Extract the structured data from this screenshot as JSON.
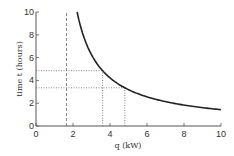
{
  "chart_data": {
    "type": "line",
    "title": "",
    "xlabel": "q (kW)",
    "ylabel": "time t (hours)",
    "xlim": [
      0,
      10
    ],
    "ylim": [
      0,
      10
    ],
    "xticks": [
      "0",
      "2",
      "4",
      "6",
      "8",
      "10"
    ],
    "yticks": [
      "0",
      "2",
      "4",
      "6",
      "8",
      "10"
    ],
    "grid": false,
    "series": [
      {
        "name": "t(q)",
        "x": [
          2.22,
          2.5,
          3,
          3.6,
          4,
          4.8,
          5,
          6,
          7,
          8,
          9,
          10
        ],
        "y": [
          10.0,
          8.2,
          6.25,
          4.85,
          4.2,
          3.35,
          3.2,
          2.56,
          2.14,
          1.84,
          1.61,
          1.43
        ]
      }
    ],
    "annotations": [
      {
        "type": "vertical-dashed",
        "x": 1.65
      },
      {
        "type": "horizontal-dotted",
        "y": 4.85,
        "x_to": 3.6
      },
      {
        "type": "horizontal-dotted",
        "y": 3.35,
        "x_to": 4.8
      },
      {
        "type": "vertical-dotted",
        "x": 3.6,
        "y_to": 4.85
      },
      {
        "type": "vertical-dotted",
        "x": 4.8,
        "y_to": 3.35
      }
    ]
  }
}
